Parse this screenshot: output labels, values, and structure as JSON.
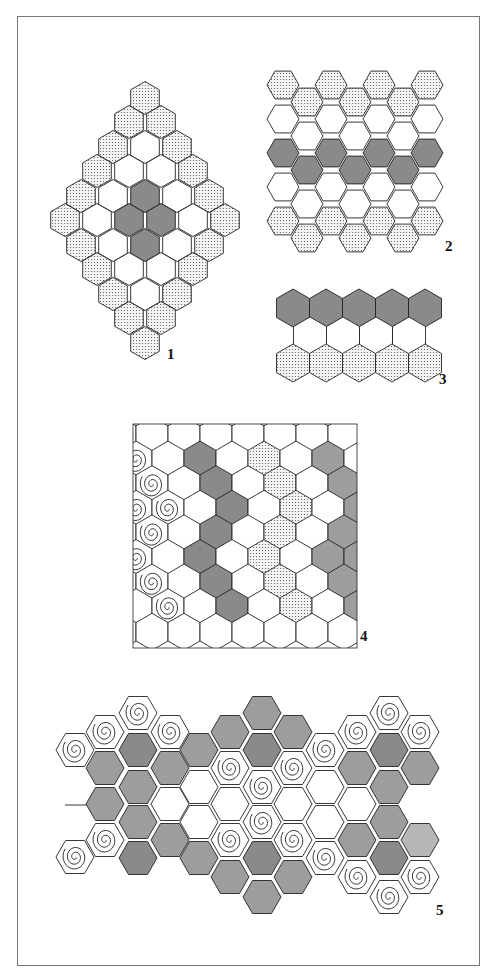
{
  "colors": {
    "outline": "#222222",
    "dark_gray": "#8a8a8a",
    "stipple_bg": "#f4f4f4",
    "stipple_dot": "#555555",
    "dense_stipple_bg": "#b8b8b8",
    "dense_stipple_dot": "#606060",
    "white": "#ffffff",
    "spiral": "#222222"
  },
  "figures": [
    {
      "label": "1",
      "description": "Diamond of 36 pointy-top hexagons: stippled border ring, white middle ring, four dark gray center hexes",
      "orientation": "pointy",
      "size": 16.5,
      "label_pos": [
        171,
        356
      ],
      "cells": [
        [
          145,
          98,
          "stipple"
        ],
        [
          129,
          122,
          "stipple"
        ],
        [
          161,
          122,
          "stipple"
        ],
        [
          113,
          147,
          "stipple"
        ],
        [
          145,
          147,
          "white"
        ],
        [
          177,
          147,
          "stipple"
        ],
        [
          97,
          171,
          "stipple"
        ],
        [
          129,
          171,
          "white"
        ],
        [
          161,
          171,
          "white"
        ],
        [
          193,
          171,
          "stipple"
        ],
        [
          81,
          196,
          "stipple"
        ],
        [
          113,
          196,
          "white"
        ],
        [
          145,
          196,
          "gray"
        ],
        [
          177,
          196,
          "white"
        ],
        [
          209,
          196,
          "stipple"
        ],
        [
          65,
          220,
          "stipple"
        ],
        [
          97,
          220,
          "white"
        ],
        [
          129,
          220,
          "gray"
        ],
        [
          161,
          220,
          "gray"
        ],
        [
          193,
          220,
          "white"
        ],
        [
          225,
          220,
          "stipple"
        ],
        [
          81,
          245,
          "stipple"
        ],
        [
          113,
          245,
          "white"
        ],
        [
          145,
          245,
          "gray"
        ],
        [
          177,
          245,
          "white"
        ],
        [
          209,
          245,
          "stipple"
        ],
        [
          97,
          269,
          "stipple"
        ],
        [
          129,
          269,
          "white"
        ],
        [
          161,
          269,
          "white"
        ],
        [
          193,
          269,
          "stipple"
        ],
        [
          113,
          294,
          "stipple"
        ],
        [
          145,
          294,
          "white"
        ],
        [
          177,
          294,
          "stipple"
        ],
        [
          129,
          318,
          "stipple"
        ],
        [
          161,
          318,
          "stipple"
        ],
        [
          145,
          343,
          "stipple"
        ]
      ]
    },
    {
      "label": "2",
      "description": "Seven columns of flat-top hexagons: stippled top and bottom rows, white rows, dark gray middle band",
      "orientation": "flat",
      "size": 16,
      "label_pos": [
        449,
        248
      ],
      "cells": [
        [
          283,
          85,
          "stipple"
        ],
        [
          283,
          119,
          "white"
        ],
        [
          283,
          153,
          "gray"
        ],
        [
          283,
          187,
          "white"
        ],
        [
          283,
          221,
          "stipple"
        ],
        [
          307,
          102,
          "stipple"
        ],
        [
          307,
          136,
          "white"
        ],
        [
          307,
          170,
          "gray"
        ],
        [
          307,
          204,
          "white"
        ],
        [
          307,
          238,
          "stipple"
        ],
        [
          331,
          85,
          "stipple"
        ],
        [
          331,
          119,
          "white"
        ],
        [
          331,
          153,
          "gray"
        ],
        [
          331,
          187,
          "white"
        ],
        [
          331,
          221,
          "stipple"
        ],
        [
          355,
          102,
          "stipple"
        ],
        [
          355,
          136,
          "white"
        ],
        [
          355,
          170,
          "gray"
        ],
        [
          355,
          204,
          "white"
        ],
        [
          355,
          238,
          "stipple"
        ],
        [
          379,
          85,
          "stipple"
        ],
        [
          379,
          119,
          "white"
        ],
        [
          379,
          153,
          "gray"
        ],
        [
          379,
          187,
          "white"
        ],
        [
          379,
          221,
          "stipple"
        ],
        [
          403,
          102,
          "stipple"
        ],
        [
          403,
          136,
          "white"
        ],
        [
          403,
          170,
          "gray"
        ],
        [
          403,
          204,
          "white"
        ],
        [
          403,
          238,
          "stipple"
        ],
        [
          427,
          85,
          "stipple"
        ],
        [
          427,
          119,
          "white"
        ],
        [
          427,
          153,
          "gray"
        ],
        [
          427,
          187,
          "white"
        ],
        [
          427,
          221,
          "stipple"
        ]
      ]
    },
    {
      "label": "3",
      "description": "Three rows of pointy-top hexagons: dark gray top row, white middle row, stippled bottom row",
      "orientation": "pointy",
      "size": 19,
      "label_pos": [
        443,
        381
      ],
      "cells": [
        [
          293,
          308,
          "gray"
        ],
        [
          326,
          308,
          "gray"
        ],
        [
          359,
          308,
          "gray"
        ],
        [
          392,
          308,
          "gray"
        ],
        [
          425,
          308,
          "gray"
        ],
        [
          310,
          336,
          "white"
        ],
        [
          343,
          336,
          "white"
        ],
        [
          376,
          336,
          "white"
        ],
        [
          409,
          336,
          "white"
        ],
        [
          293,
          363,
          "stipple"
        ],
        [
          326,
          363,
          "stipple"
        ],
        [
          359,
          363,
          "stipple"
        ],
        [
          392,
          363,
          "stipple"
        ],
        [
          425,
          363,
          "stipple"
        ]
      ]
    },
    {
      "label": "4",
      "description": "Rectangular pointy-top hex grid with spiral column at left, dark gray zigzag, stippled zigzag and dense stippled zigzag at right",
      "orientation": "pointy",
      "size": 18.5,
      "clip": [
        133,
        424,
        224,
        224
      ],
      "label_pos": [
        364,
        638
      ],
      "grid": {
        "x0": 152,
        "y0": 435,
        "dx": 32,
        "dy": 24.6,
        "rows": 9,
        "cols_min": -1,
        "cols_max": 7,
        "odd_shift": 16
      },
      "special": [
        [
          1,
          -1,
          "spiral"
        ],
        [
          1,
          1,
          "gray"
        ],
        [
          1,
          3,
          "stipple"
        ],
        [
          1,
          5,
          "dense"
        ],
        [
          2,
          0,
          "spiral"
        ],
        [
          2,
          2,
          "gray"
        ],
        [
          2,
          4,
          "stipple"
        ],
        [
          2,
          6,
          "dense"
        ],
        [
          3,
          -1,
          "spiral"
        ],
        [
          3,
          0,
          "spiral"
        ],
        [
          3,
          2,
          "gray"
        ],
        [
          3,
          4,
          "stipple"
        ],
        [
          3,
          6,
          "dense"
        ],
        [
          4,
          0,
          "spiral"
        ],
        [
          4,
          2,
          "gray"
        ],
        [
          4,
          4,
          "stipple"
        ],
        [
          4,
          6,
          "dense"
        ],
        [
          5,
          -1,
          "spiral"
        ],
        [
          5,
          1,
          "gray"
        ],
        [
          5,
          3,
          "stipple"
        ],
        [
          5,
          5,
          "dense"
        ],
        [
          5,
          6,
          "dense"
        ],
        [
          6,
          0,
          "spiral"
        ],
        [
          6,
          2,
          "gray"
        ],
        [
          6,
          4,
          "stipple"
        ],
        [
          6,
          6,
          "dense"
        ],
        [
          7,
          0,
          "spiral"
        ],
        [
          7,
          2,
          "gray"
        ],
        [
          7,
          4,
          "stipple"
        ],
        [
          7,
          6,
          "dense"
        ]
      ]
    },
    {
      "label": "5",
      "description": "Irregular band of flat-top hexagons with spiral hexes, dark gray and dense stippled hexes, white path",
      "orientation": "flat",
      "size": 19,
      "label_pos": [
        440,
        912
      ],
      "left_line": [
        [
          65,
          805
        ],
        [
          90,
          805
        ]
      ],
      "cells": [
        [
          75,
          750,
          "spiral"
        ],
        [
          75,
          857,
          "spiral"
        ],
        [
          105,
          732,
          "spiral"
        ],
        [
          105,
          768,
          "dense"
        ],
        [
          105,
          804,
          "dense"
        ],
        [
          105,
          840,
          "spiral"
        ],
        [
          138,
          713,
          "spiral"
        ],
        [
          138,
          750,
          "gray"
        ],
        [
          138,
          787,
          "dense"
        ],
        [
          138,
          822,
          "dense"
        ],
        [
          138,
          858,
          "gray"
        ],
        [
          170,
          732,
          "spiral"
        ],
        [
          170,
          768,
          "dense"
        ],
        [
          170,
          804,
          "white"
        ],
        [
          170,
          840,
          "dense"
        ],
        [
          199,
          750,
          "dense"
        ],
        [
          199,
          787,
          "white"
        ],
        [
          199,
          822,
          "white"
        ],
        [
          199,
          858,
          "dense"
        ],
        [
          230,
          732,
          "dense"
        ],
        [
          230,
          768,
          "spiral"
        ],
        [
          230,
          804,
          "white"
        ],
        [
          230,
          840,
          "spiral"
        ],
        [
          230,
          877,
          "dense"
        ],
        [
          262,
          713,
          "dense"
        ],
        [
          262,
          750,
          "gray"
        ],
        [
          262,
          787,
          "spiral"
        ],
        [
          262,
          822,
          "spiral"
        ],
        [
          262,
          858,
          "gray"
        ],
        [
          262,
          897,
          "dense"
        ],
        [
          293,
          732,
          "dense"
        ],
        [
          293,
          768,
          "spiral"
        ],
        [
          293,
          804,
          "white"
        ],
        [
          293,
          840,
          "spiral"
        ],
        [
          293,
          877,
          "dense"
        ],
        [
          325,
          750,
          "spiral"
        ],
        [
          325,
          787,
          "white"
        ],
        [
          325,
          822,
          "white"
        ],
        [
          325,
          858,
          "spiral"
        ],
        [
          357,
          732,
          "spiral"
        ],
        [
          357,
          768,
          "dense"
        ],
        [
          357,
          804,
          "white"
        ],
        [
          357,
          840,
          "dense"
        ],
        [
          357,
          877,
          "spiral"
        ],
        [
          389,
          713,
          "spiral"
        ],
        [
          389,
          750,
          "gray"
        ],
        [
          389,
          787,
          "dense"
        ],
        [
          389,
          822,
          "dense"
        ],
        [
          389,
          858,
          "gray"
        ],
        [
          389,
          897,
          "spiral"
        ],
        [
          420,
          732,
          "spiral"
        ],
        [
          420,
          768,
          "dense"
        ],
        [
          420,
          840,
          "finedense"
        ],
        [
          420,
          877,
          "spiral"
        ]
      ]
    }
  ]
}
